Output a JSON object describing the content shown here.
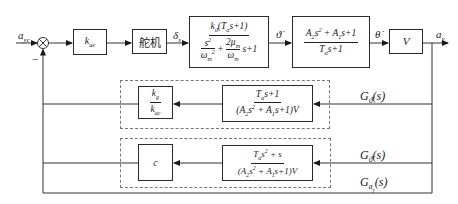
{
  "diagram": {
    "type": "control-block-diagram",
    "input_signal": "a_yc",
    "summing_junction": {
      "sign": "−"
    },
    "forward_path": [
      {
        "id": "kac",
        "label": "k_ac"
      },
      {
        "id": "actuator",
        "label": "舵机"
      },
      {
        "id": "airframe1",
        "numerator": "k_ϑ̇(T_α s+1)",
        "denominator": "s²/ω_m² + 2μ_m/ω_m s + 1"
      },
      {
        "id": "airframe2",
        "numerator": "A₂s² + A₁s + 1",
        "denominator": "T_α s + 1"
      },
      {
        "id": "velocity",
        "label": "V"
      }
    ],
    "signals": {
      "actuator_out": "δ_s",
      "pitch_rate": "ϑ̇",
      "path_rate": "θ̇",
      "output": "a_y"
    },
    "feedback": {
      "rate_loop": {
        "tf_numerator": "T_α s+1",
        "tf_denominator": "(A₂s² + A₁s + 1)V",
        "gain_numerator": "k_g",
        "gain_denominator": "k_ac",
        "label": "G_ϑ̇(s)"
      },
      "accel_loop": {
        "tf_numerator": "T_α s² + s",
        "tf_denominator": "(A₂s² + A₁s + 1)V",
        "gain": "c",
        "label": "G_ϑ̈(s)"
      },
      "outer_label": "G_ay(s)"
    }
  }
}
